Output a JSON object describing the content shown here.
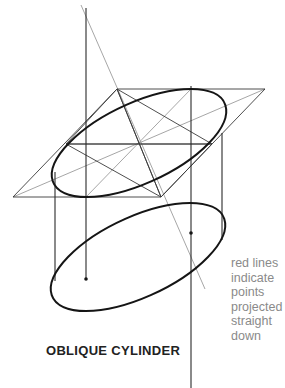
{
  "title": "OBLIQUE CYLINDER",
  "caption": {
    "lines": [
      "red lines",
      "indicate",
      "points",
      "projected",
      "straight",
      "down"
    ]
  },
  "colors": {
    "outline": "#1a1a1a",
    "construction": "#555555",
    "light_construction": "#9a9a9a",
    "caption_text": "#8a8a8a",
    "title_text": "#222222"
  },
  "figure": {
    "top_ellipse": {
      "center": [
        139,
        143
      ],
      "label": "top face"
    },
    "bottom_ellipse": {
      "center": [
        138,
        257
      ],
      "label": "bottom face"
    },
    "projection_points": [
      [
        86,
        279
      ],
      [
        191,
        233
      ]
    ]
  }
}
